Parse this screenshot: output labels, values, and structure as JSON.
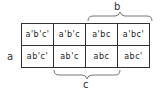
{
  "diagram": {
    "type": "karnaugh-map",
    "row_label": "a",
    "top_brace_label": "b",
    "bottom_brace_label": "c",
    "rows": [
      {
        "cells": [
          "a'b'c'",
          "a'b'c",
          "a'bc",
          "a'bc'"
        ]
      },
      {
        "cells": [
          "ab'c'",
          "ab'c",
          "abc",
          "abc'"
        ]
      }
    ]
  }
}
